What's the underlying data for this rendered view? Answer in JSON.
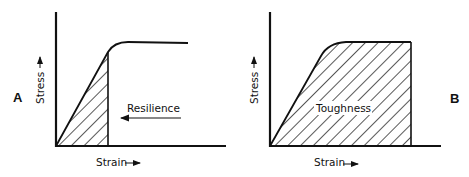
{
  "panels": [
    {
      "id": "A",
      "letter": "A",
      "y_label": "Stress",
      "x_label": "Strain",
      "area_label": "Resilience",
      "shaded_region": "elastic region under stress-strain curve up to yield point"
    },
    {
      "id": "B",
      "letter": "B",
      "y_label": "Stress",
      "x_label": "Strain",
      "area_label": "Toughness",
      "shaded_region": "entire area under stress-strain curve up to fracture"
    }
  ],
  "colors": {
    "ink": "#111111",
    "background": "#ffffff"
  }
}
